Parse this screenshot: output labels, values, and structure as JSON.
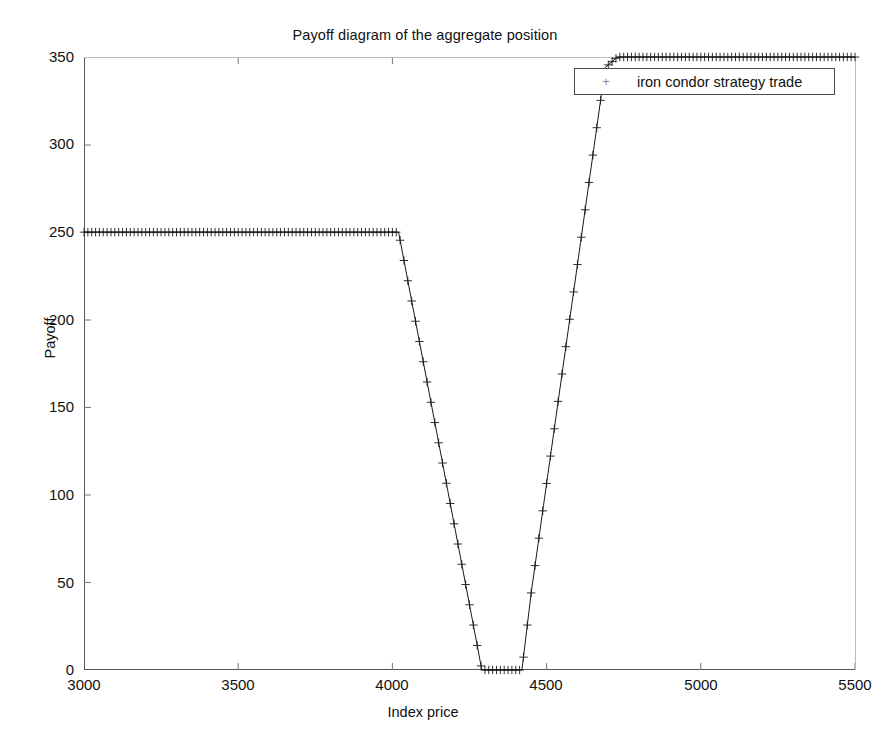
{
  "chart_data": {
    "type": "line",
    "title": "Payoff diagram of the aggregate position",
    "xlabel": "Index price",
    "ylabel": "Payoff",
    "xlim": [
      3000,
      5500
    ],
    "ylim": [
      0,
      350
    ],
    "xticks": [
      3000,
      3500,
      4000,
      4500,
      5000,
      5500
    ],
    "yticks": [
      0,
      50,
      100,
      150,
      200,
      250,
      300,
      350
    ],
    "grid": false,
    "legend_position": "top-right",
    "marker": "+",
    "line_color": "#1a1a1a",
    "series": [
      {
        "name": "iron condor strategy trade",
        "x": [
          3000,
          3050,
          3100,
          3150,
          3200,
          3250,
          3300,
          3350,
          3400,
          3450,
          3500,
          3550,
          3600,
          3650,
          3700,
          3750,
          3800,
          3850,
          3900,
          3950,
          4000,
          4020,
          4060,
          4100,
          4140,
          4180,
          4220,
          4260,
          4290,
          4320,
          4350,
          4380,
          4410,
          4420,
          4450,
          4490,
          4530,
          4570,
          4610,
          4650,
          4690,
          4730,
          4750,
          4800,
          4900,
          5000,
          5100,
          5200,
          5300,
          5400,
          5500
        ],
        "y": [
          250,
          250,
          250,
          250,
          250,
          250,
          250,
          250,
          250,
          250,
          250,
          250,
          250,
          250,
          250,
          250,
          250,
          250,
          250,
          250,
          250,
          250,
          213,
          176,
          139,
          102,
          65,
          28,
          0,
          0,
          0,
          0,
          0,
          0,
          44,
          94,
          144,
          194,
          244,
          294,
          344,
          350,
          350,
          350,
          350,
          350,
          350,
          350,
          350,
          350,
          350
        ]
      }
    ],
    "annotations": {
      "plateau_value": 250,
      "trough_value": 0,
      "clipped_top_value": 350,
      "lower_breakeven": 4020,
      "trough_start": 4290,
      "trough_end": 4420,
      "upper_clip_start": 4750
    }
  },
  "legend": {
    "marker_glyph": "+",
    "entries": [
      {
        "label": "iron condor strategy trade"
      }
    ]
  }
}
